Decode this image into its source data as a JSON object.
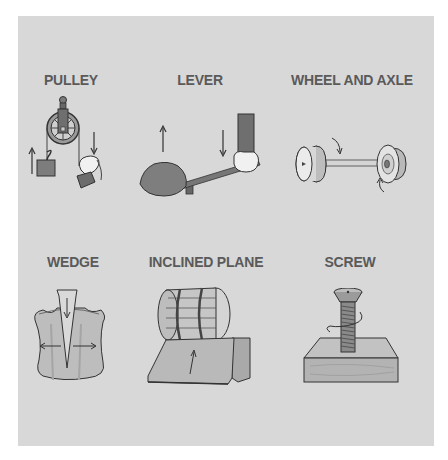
{
  "diagram": {
    "colors": {
      "background": "#ffffff",
      "panel": "#d8d8d8",
      "label_text": "#5a5a5a",
      "outline": "#3a3a3a",
      "metal_light": "#e4e4e4",
      "metal_dark": "#8c8c8c",
      "wood": "#b8b8b8"
    },
    "machines": [
      {
        "id": "pulley",
        "label": "PULLEY",
        "row": 1,
        "col": 1,
        "arrows": [
          "up (load side)",
          "down (pull side)"
        ]
      },
      {
        "id": "lever",
        "label": "LEVER",
        "row": 1,
        "col": 2,
        "arrows": [
          "up (rock)",
          "down (hand)"
        ]
      },
      {
        "id": "wheel-and-axle",
        "label": "WHEEL AND AXLE",
        "row": 1,
        "col": 3,
        "arrows": [
          "rotation top",
          "rotation bottom"
        ]
      },
      {
        "id": "wedge",
        "label": "WEDGE",
        "row": 2,
        "col": 1,
        "arrows": [
          "down (wedge)",
          "left (split)",
          "right (split)"
        ]
      },
      {
        "id": "inclined-plane",
        "label": "INCLINED PLANE",
        "row": 2,
        "col": 2,
        "arrows": [
          "up the ramp"
        ]
      },
      {
        "id": "screw",
        "label": "SCREW",
        "row": 2,
        "col": 3,
        "arrows": [
          "rotation around shaft"
        ]
      }
    ]
  }
}
